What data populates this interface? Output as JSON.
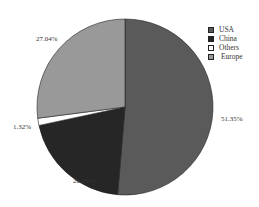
{
  "chart_data": {
    "type": "pie",
    "title": "",
    "categories": [
      "USA",
      "China",
      "Others",
      "Europe"
    ],
    "values": [
      51.35,
      20.29,
      1.32,
      27.04
    ],
    "labels": [
      "51.35%",
      "20.29%",
      "1.32%",
      "27.04%"
    ],
    "colors": [
      "#5a5a5a",
      "#262626",
      "#ffffff",
      "#999999"
    ],
    "legend_position": "upper right",
    "start_angle": "12 o'clock",
    "direction": "clockwise"
  },
  "legend": [
    {
      "label": "USA",
      "color": "#5a5a5a"
    },
    {
      "label": "China",
      "color": "#262626"
    },
    {
      "label": "Others",
      "color": "#ffffff"
    },
    {
      "label": "Europe",
      "color": "#999999"
    }
  ],
  "slice_labels": {
    "usa": "51.35%",
    "china": "20.29%",
    "others": "1.32%",
    "europe": "27.04%"
  }
}
